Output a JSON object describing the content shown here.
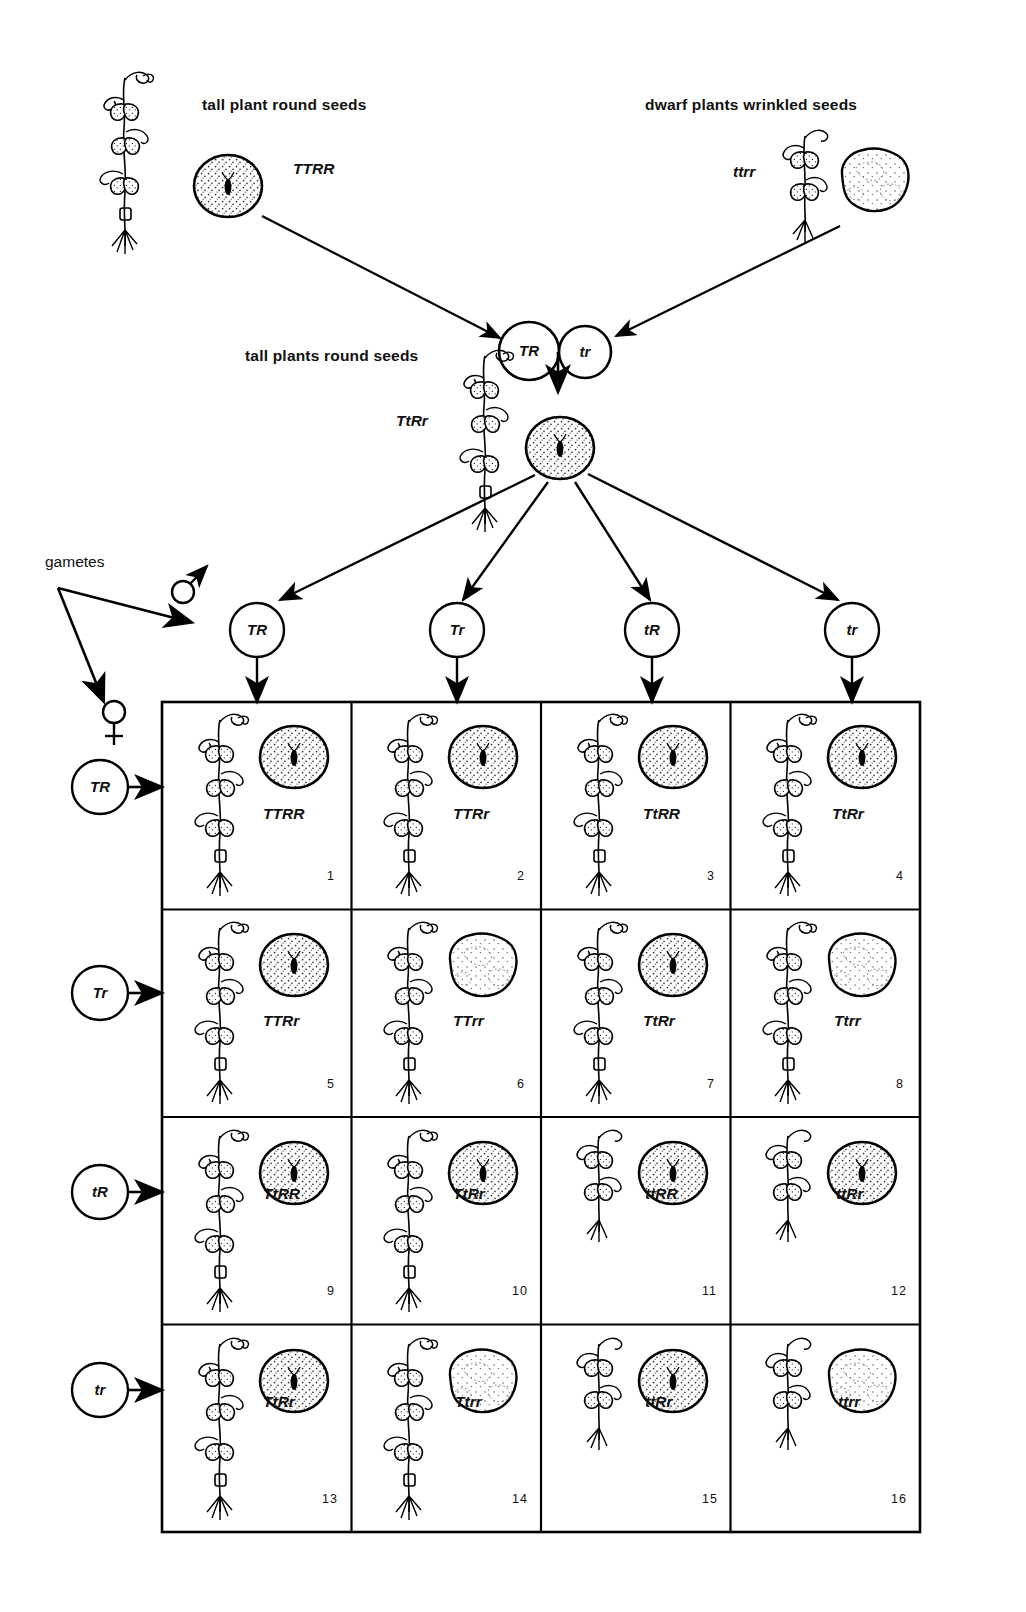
{
  "diagram": {
    "title_parent_left": "tall plant round seeds",
    "title_parent_right": "dwarf plants wrinkled seeds",
    "title_f1": "tall plants round seeds",
    "gametes_label": "gametes",
    "male_symbol": "male-symbol",
    "female_symbol": "female-symbol"
  },
  "parents": {
    "left": {
      "label": "tall plant round seeds",
      "genotype": "TTRR",
      "seed_type": "round"
    },
    "right": {
      "label": "dwarf plants wrinkled seeds",
      "genotype": "ttrr",
      "seed_type": "wrinkled"
    }
  },
  "fusion": {
    "left_gamete": "TR",
    "right_gamete": "tr"
  },
  "f1": {
    "label": "tall plants round seeds",
    "genotype": "TtRr",
    "seed_type": "round"
  },
  "gametes": {
    "male_row": [
      "TR",
      "Tr",
      "tR",
      "tr"
    ],
    "female_column": [
      "TR",
      "Tr",
      "tR",
      "tr"
    ]
  },
  "punnett": {
    "columns": [
      "TR",
      "Tr",
      "tR",
      "tr"
    ],
    "rows": [
      "TR",
      "Tr",
      "tR",
      "tr"
    ],
    "cells": [
      {
        "n": "1",
        "genotype": "TTRR",
        "seed": "round",
        "plant": "tall"
      },
      {
        "n": "2",
        "genotype": "TTRr",
        "seed": "round",
        "plant": "tall"
      },
      {
        "n": "3",
        "genotype": "TtRR",
        "seed": "round",
        "plant": "tall"
      },
      {
        "n": "4",
        "genotype": "TtRr",
        "seed": "round",
        "plant": "tall"
      },
      {
        "n": "5",
        "genotype": "TTRr",
        "seed": "round",
        "plant": "tall"
      },
      {
        "n": "6",
        "genotype": "TTrr",
        "seed": "wrinkled",
        "plant": "tall"
      },
      {
        "n": "7",
        "genotype": "TtRr",
        "seed": "round",
        "plant": "tall"
      },
      {
        "n": "8",
        "genotype": "Ttrr",
        "seed": "wrinkled",
        "plant": "tall"
      },
      {
        "n": "9",
        "genotype": "TtRR",
        "seed": "round",
        "plant": "tall"
      },
      {
        "n": "10",
        "genotype": "TtRr",
        "seed": "round",
        "plant": "tall"
      },
      {
        "n": "11",
        "genotype": "ttRR",
        "seed": "round",
        "plant": "dwarf"
      },
      {
        "n": "12",
        "genotype": "ttRr",
        "seed": "round",
        "plant": "dwarf"
      },
      {
        "n": "13",
        "genotype": "TtRr",
        "seed": "round",
        "plant": "tall"
      },
      {
        "n": "14",
        "genotype": "Ttrr",
        "seed": "wrinkled",
        "plant": "tall"
      },
      {
        "n": "15",
        "genotype": "ttRr",
        "seed": "round",
        "plant": "dwarf"
      },
      {
        "n": "16",
        "genotype": "ttrr",
        "seed": "wrinkled",
        "plant": "dwarf"
      }
    ]
  },
  "colors": {
    "ink": "#000000",
    "paper": "#ffffff"
  }
}
